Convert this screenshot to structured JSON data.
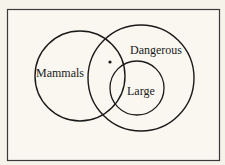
{
  "diagram": {
    "type": "venn",
    "frame": {
      "x": 7,
      "y": 9,
      "width": 213,
      "height": 152,
      "stroke": "#3a3a3a"
    },
    "background": "#f6f3ea",
    "sets": [
      {
        "name": "Mammals",
        "label": "Mammals",
        "cx": 80,
        "cy": 76,
        "r": 45
      },
      {
        "name": "Dangerous",
        "label": "Dangerous",
        "cx": 141,
        "cy": 78,
        "r": 53
      },
      {
        "name": "Large",
        "label": "Large",
        "cx": 137,
        "cy": 88,
        "r": 27
      }
    ],
    "point": {
      "x": 110,
      "y": 62,
      "r": 1.6
    },
    "stroke_color": "#1a1a1a"
  }
}
